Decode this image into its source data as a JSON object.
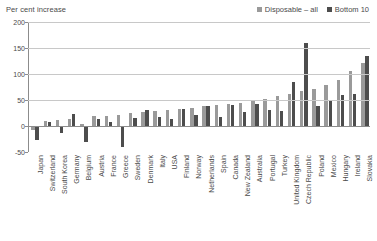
{
  "chart_data": {
    "type": "bar",
    "title": "Per cent increase",
    "xlabel": "",
    "ylabel": "Per cent increase",
    "ylim": [
      -50,
      200
    ],
    "yticks": [
      200,
      150,
      100,
      50,
      0,
      -50
    ],
    "grid": true,
    "legend_position": "top-right",
    "categories": [
      "Japan",
      "Switzerland",
      "South Korea",
      "Germany",
      "Belgium",
      "Austria",
      "France",
      "Greece",
      "Sweden",
      "Denmark",
      "Italy",
      "USA",
      "Finland",
      "Norway",
      "Netherlands",
      "Spain",
      "Canada",
      "New Zealand",
      "Australia",
      "Portugal",
      "Turkey",
      "United Kingdom",
      "Czech Republic",
      "Poland",
      "Mexico",
      "Hungary",
      "Ireland",
      "Slovakia"
    ],
    "series": [
      {
        "name": "Disposable – all",
        "color": "#9a9a9a",
        "values": [
          -7,
          10,
          12,
          13,
          3,
          19,
          20,
          22,
          25,
          26,
          28,
          30,
          33,
          35,
          38,
          40,
          42,
          45,
          48,
          52,
          58,
          62,
          68,
          72,
          78,
          88,
          105,
          122
        ]
      },
      {
        "name": "Bottom 10",
        "color": "#4d4d4d",
        "values": [
          -27,
          7,
          -13,
          24,
          -30,
          13,
          8,
          -40,
          16,
          31,
          18,
          14,
          32,
          22,
          38,
          18,
          40,
          26,
          42,
          30,
          28,
          85,
          160,
          38,
          48,
          60,
          62,
          135
        ]
      }
    ]
  },
  "legend": {
    "items": [
      {
        "label": "Disposable – all",
        "color": "#9a9a9a"
      },
      {
        "label": "Bottom 10",
        "color": "#4d4d4d"
      }
    ]
  }
}
